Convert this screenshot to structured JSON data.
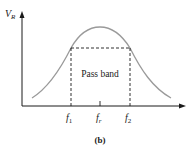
{
  "figure": {
    "panel_label": "(b)",
    "y_axis_label": {
      "main": "V",
      "sub": "R"
    },
    "region_label": "Pass band",
    "x_ticks": [
      {
        "main": "f",
        "sub": "1"
      },
      {
        "main": "f",
        "sub": "r"
      },
      {
        "main": "f",
        "sub": "2"
      }
    ],
    "colors": {
      "curve": "#9a9a9a",
      "axes": "#1a1a1a",
      "dashes": "#1a1a1a",
      "text": "#1a1a1a"
    }
  }
}
